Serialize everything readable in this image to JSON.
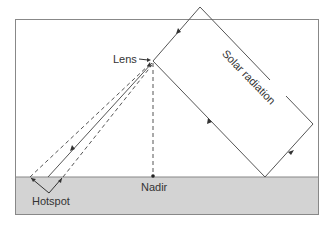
{
  "diagram": {
    "labels": {
      "lens": "Lens",
      "solar_radiation": "Solar radiation",
      "nadir": "Nadir",
      "hotspot": "Hotspot"
    },
    "colors": {
      "ground": "#d3d3d3",
      "line": "#555555",
      "frame": "#888888",
      "text": "#333333"
    }
  }
}
